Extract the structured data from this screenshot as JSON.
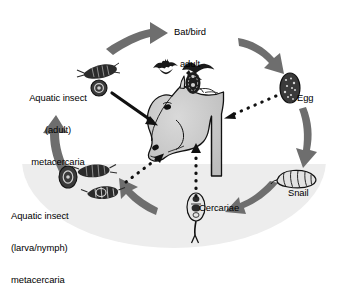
{
  "diagram": {
    "type": "life-cycle",
    "colors": {
      "water": "#ededed",
      "arrow_gray": "#6e6e6e",
      "outline_black": "#111111",
      "horse_fill": "#c9c9c9",
      "background": "#ffffff"
    },
    "labels": {
      "bat_bird": "Bat/bird\nadult",
      "bat_bird_line1": "Bat/bird",
      "bat_bird_line2": "adult",
      "egg": "Egg",
      "snail": "Snail",
      "cercariae": "Cercariae",
      "aquatic_insect_adult": "Aquatic insect\n(adult)\nmetacercaria",
      "aquatic_insect_adult_line1": "Aquatic insect",
      "aquatic_insect_adult_line2": "(adult)",
      "aquatic_insect_adult_line3": "metacercaria",
      "aquatic_insect_larva": "Aquatic insect\n(larva/nymph)\nmetacercaria",
      "aquatic_insect_larva_line1": "Aquatic insect",
      "aquatic_insect_larva_line2": "(larva/nymph)",
      "aquatic_insect_larva_line3": "metacercaria"
    },
    "stages": [
      {
        "id": "bat-bird-adult",
        "label": "Bat/bird adult",
        "position": "top-center"
      },
      {
        "id": "egg",
        "label": "Egg",
        "position": "right-upper"
      },
      {
        "id": "snail",
        "label": "Snail",
        "position": "right-lower"
      },
      {
        "id": "cercariae",
        "label": "Cercariae",
        "position": "bottom-center"
      },
      {
        "id": "aquatic-insect-larva",
        "label": "Aquatic insect (larva/nymph) metacercaria",
        "position": "left-lower"
      },
      {
        "id": "aquatic-insect-adult",
        "label": "Aquatic insect (adult) metacercaria",
        "position": "left-upper"
      },
      {
        "id": "horse",
        "label": "Horse (definitive host)",
        "position": "center"
      }
    ],
    "arrows": [
      {
        "id": "insect-adult-to-bat-bird",
        "style": "solid-gray-curved",
        "from": "aquatic-insect-adult",
        "to": "bat-bird-adult"
      },
      {
        "id": "bat-bird-to-egg",
        "style": "solid-gray-curved",
        "from": "bat-bird-adult",
        "to": "egg"
      },
      {
        "id": "egg-to-snail",
        "style": "solid-gray-curved",
        "from": "egg",
        "to": "snail"
      },
      {
        "id": "snail-to-cercariae",
        "style": "solid-gray-curved",
        "from": "snail",
        "to": "cercariae"
      },
      {
        "id": "cercariae-to-insect-larva",
        "style": "solid-gray-curved",
        "from": "cercariae",
        "to": "aquatic-insect-larva"
      },
      {
        "id": "insect-larva-to-insect-adult",
        "style": "solid-gray-curved",
        "from": "aquatic-insect-larva",
        "to": "aquatic-insect-adult"
      },
      {
        "id": "insect-adult-to-horse",
        "style": "solid-black-straight",
        "from": "aquatic-insect-adult",
        "to": "horse"
      },
      {
        "id": "egg-to-horse",
        "style": "dotted-black",
        "from": "egg",
        "to": "horse"
      },
      {
        "id": "insect-larva-to-horse",
        "style": "dotted-black",
        "from": "aquatic-insect-larva",
        "to": "horse"
      },
      {
        "id": "cercariae-to-horse",
        "style": "dotted-black",
        "from": "cercariae",
        "to": "horse"
      }
    ]
  }
}
